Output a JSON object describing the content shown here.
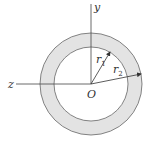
{
  "diagram": {
    "type": "annulus-cross-section",
    "center": {
      "x": 91,
      "y": 84
    },
    "outer_radius": 51,
    "inner_radius": 37,
    "ring_fill": "#e3e3e3",
    "stroke": "#555555",
    "labels": {
      "y_axis": "y",
      "z_axis": "z",
      "origin": "O",
      "r1": "r",
      "r1_sub": "1",
      "r2": "r",
      "r2_sub": "2"
    }
  }
}
